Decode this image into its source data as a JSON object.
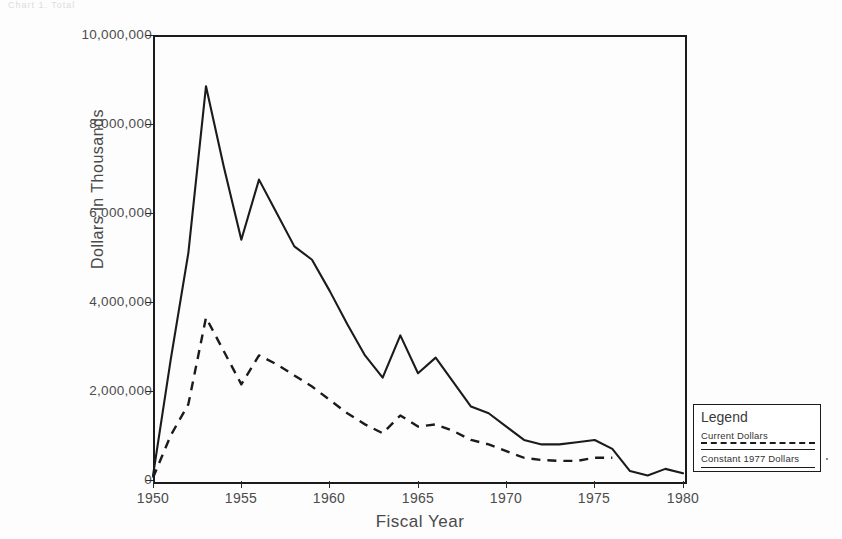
{
  "page": {
    "top_strip_text": "Chart 1. Total",
    "background": "#ffffff"
  },
  "axes": {
    "y_axis_title": "Dollars in Thousands",
    "x_axis_title": "Fiscal Year",
    "y_ticks": [
      "0",
      "2,000,000",
      "4,000,000",
      "6,000,000",
      "8,000,000",
      "10,000,000"
    ],
    "x_ticks": [
      "1950",
      "1955",
      "1960",
      "1965",
      "1970",
      "1975",
      "1980"
    ]
  },
  "legend": {
    "title": "Legend",
    "series_1_label": "Current Dollars",
    "series_2_label": "Constant 1977 Dollars"
  },
  "colors": {
    "line": "#1b1b1b",
    "axis": "#1b1b1b",
    "text": "#4a4a4a"
  },
  "chart_data": {
    "type": "line",
    "title": "",
    "subtitle": "",
    "xlabel": "Fiscal Year",
    "ylabel": "Dollars in Thousands",
    "xlim": [
      1950,
      1980
    ],
    "ylim": [
      0,
      10000000
    ],
    "grid": false,
    "legend_position": "right-bottom-outside",
    "x": [
      1950,
      1951,
      1952,
      1953,
      1954,
      1955,
      1956,
      1957,
      1958,
      1959,
      1960,
      1961,
      1962,
      1963,
      1964,
      1965,
      1966,
      1967,
      1968,
      1969,
      1970,
      1971,
      1972,
      1973,
      1974,
      1975,
      1976,
      1977,
      1978,
      1979,
      1980
    ],
    "series": [
      {
        "name": "Current Dollars",
        "style": "solid",
        "values": [
          100000,
          2700000,
          5100000,
          8850000,
          7050000,
          5400000,
          6750000,
          6000000,
          5250000,
          4950000,
          4250000,
          3500000,
          2800000,
          2300000,
          3250000,
          2400000,
          2750000,
          2200000,
          1650000,
          1500000,
          1200000,
          900000,
          800000,
          800000,
          850000,
          900000,
          700000,
          200000,
          100000,
          250000,
          150000
        ]
      },
      {
        "name": "Constant 1977 Dollars",
        "style": "dashed",
        "values": [
          50000,
          1000000,
          1700000,
          3650000,
          2900000,
          2150000,
          2800000,
          2600000,
          2350000,
          2100000,
          1800000,
          1500000,
          1250000,
          1050000,
          1450000,
          1200000,
          1250000,
          1100000,
          900000,
          800000,
          650000,
          500000,
          450000,
          430000,
          430000,
          500000,
          500000,
          0,
          0,
          0,
          0
        ]
      }
    ]
  }
}
